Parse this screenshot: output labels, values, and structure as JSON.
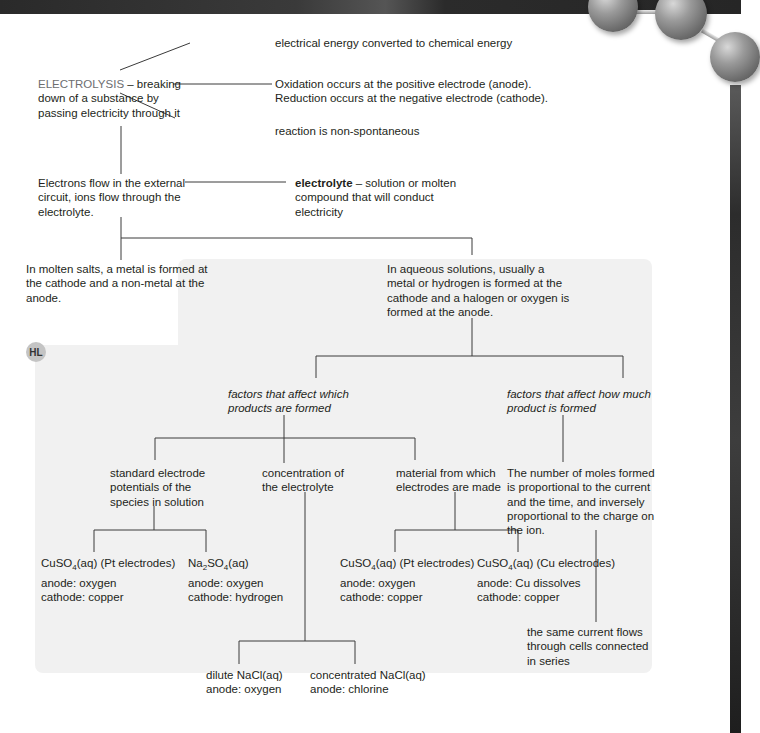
{
  "root": {
    "term": "ELECTROLYSIS",
    "definition": " – breaking\ndown of a substance by\npassing electricity through it"
  },
  "properties": [
    "electrical energy converted to chemical energy",
    "Oxidation occurs at the positive electrode (anode).\nReduction occurs at the negative electrode (cathode).",
    "reaction is non-spontaneous"
  ],
  "conduction": {
    "text": "Electrons flow in the external\ncircuit, ions flow through the\nelectrolyte.",
    "electrolyte_term": "electrolyte",
    "electrolyte_def": " – solution or molten\ncompound that will conduct\nelectricity"
  },
  "molten": "In molten salts, a metal is formed at\nthe cathode and a non-metal at the\nanode.",
  "aqueous": "In aqueous solutions, usually a\nmetal or hydrogen is formed at the\ncathode and a halogen or oxygen is\nformed at the anode.",
  "hl_badge": "HL",
  "factors_which": "factors that affect which\nproducts are formed",
  "factors_how_much": "factors that affect how much\nproduct is formed",
  "factor_items": [
    "standard electrode\npotentials of the\nspecies in solution",
    "concentration of\nthe electrolyte",
    "material from which\nelectrodes are made"
  ],
  "moles_statement": "The number of moles formed\nis proportional to the current\nand the time, and inversely\nproportional to the charge on\nthe ion.",
  "series_statement": "the same current flows\nthrough cells connected\nin series",
  "examples": {
    "potentials": [
      {
        "formula": "CuSO",
        "sub": "4",
        "rest": "(aq) (Pt electrodes)",
        "anode": "anode: oxygen",
        "cathode": "cathode: copper"
      },
      {
        "formula": "Na",
        "sub": "2",
        "mid": "SO",
        "sub2": "4",
        "rest": "(aq)",
        "anode": "anode: oxygen",
        "cathode": "cathode: hydrogen"
      }
    ],
    "electrodes": [
      {
        "formula": "CuSO",
        "sub": "4",
        "rest": "(aq) (Pt electrodes)",
        "anode": "anode: oxygen",
        "cathode": "cathode: copper"
      },
      {
        "formula": "CuSO",
        "sub": "4",
        "rest": "(aq) (Cu electrodes)",
        "anode": "anode: Cu dissolves",
        "cathode": "cathode: copper"
      }
    ],
    "concentration": [
      {
        "line1": "dilute NaCl(aq)",
        "line2": "anode: oxygen"
      },
      {
        "line1": "concentrated NaCl(aq)",
        "line2": "anode: chlorine"
      }
    ]
  }
}
